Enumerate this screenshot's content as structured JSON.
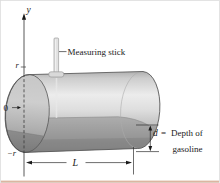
{
  "figure": {
    "labels": {
      "y_axis": "y",
      "radius_top": "r",
      "origin": "0",
      "radius_bottom": "−r",
      "measuring_stick": "Measuring stick",
      "length": "L",
      "depth_var": "d",
      "equals": "=",
      "depth_text_line1": "Depth of",
      "depth_text_line2": "gasoline"
    },
    "colors": {
      "background": "#ffffff",
      "tank_highlight": "#ececec",
      "tank_mid": "#c6c6c6",
      "tank_dark": "#8f8f8f",
      "gasoline_shade": "#6f6f6f",
      "outline": "#4f4f4f",
      "text": "#1a1a1a",
      "bottom_rule": "#d7ae97"
    }
  }
}
